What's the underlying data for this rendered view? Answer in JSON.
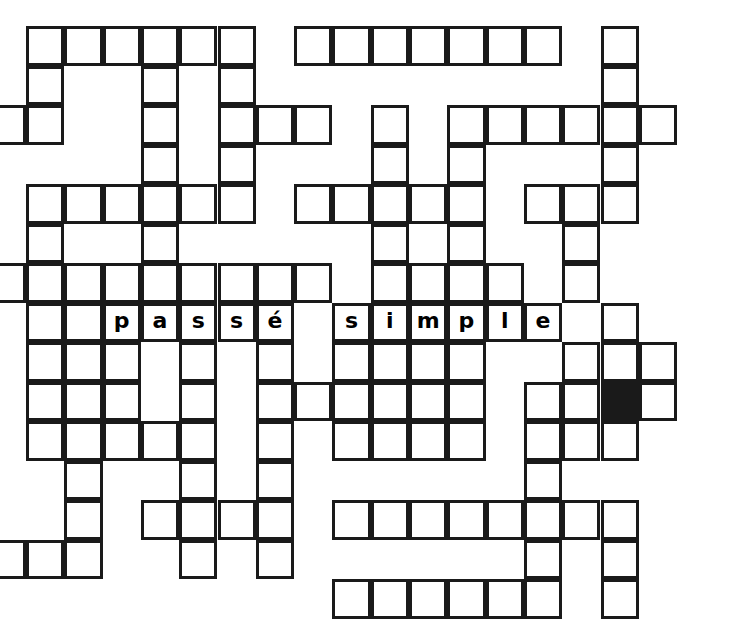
{
  "puzzle": {
    "type": "crossword-grid",
    "title": "passé simple crossword grid",
    "columns": 18,
    "rows": 15,
    "cell_size": 38.3,
    "row_size": 39.5,
    "origin_x": 26,
    "origin_y": 26,
    "colors": {
      "grid_line": "#1a1a1a",
      "cell_background": "#ffffff",
      "blocked_cell": "#1a1a1a",
      "page_background": "#ffffff"
    },
    "answer_entry": {
      "text": "passé simple",
      "word_one": "passé",
      "word_two": "simple",
      "row": 8,
      "word_one_start_col": 3,
      "word_two_start_col": 9
    },
    "blocked_cells": [
      {
        "row": 10,
        "col": 16
      }
    ],
    "letters": [
      {
        "row": 8,
        "col": 3,
        "char": "p"
      },
      {
        "row": 8,
        "col": 4,
        "char": "a"
      },
      {
        "row": 8,
        "col": 5,
        "char": "s"
      },
      {
        "row": 8,
        "col": 6,
        "char": "s"
      },
      {
        "row": 8,
        "col": 7,
        "char": "é"
      },
      {
        "row": 8,
        "col": 9,
        "char": "s"
      },
      {
        "row": 8,
        "col": 10,
        "char": "i"
      },
      {
        "row": 8,
        "col": 11,
        "char": "m"
      },
      {
        "row": 8,
        "col": 12,
        "char": "p"
      },
      {
        "row": 8,
        "col": 13,
        "char": "l"
      },
      {
        "row": 8,
        "col": 14,
        "char": "e"
      }
    ],
    "cells": [
      {
        "row": 1,
        "col": 1
      },
      {
        "row": 1,
        "col": 2
      },
      {
        "row": 1,
        "col": 3
      },
      {
        "row": 1,
        "col": 4
      },
      {
        "row": 1,
        "col": 5
      },
      {
        "row": 1,
        "col": 6
      },
      {
        "row": 1,
        "col": 8
      },
      {
        "row": 1,
        "col": 9
      },
      {
        "row": 1,
        "col": 10
      },
      {
        "row": 1,
        "col": 11
      },
      {
        "row": 1,
        "col": 12
      },
      {
        "row": 1,
        "col": 13
      },
      {
        "row": 1,
        "col": 14
      },
      {
        "row": 1,
        "col": 16
      },
      {
        "row": 2,
        "col": 1
      },
      {
        "row": 2,
        "col": 4
      },
      {
        "row": 2,
        "col": 6
      },
      {
        "row": 2,
        "col": 16
      },
      {
        "row": 3,
        "col": -1
      },
      {
        "row": 3,
        "col": 0
      },
      {
        "row": 3,
        "col": 1
      },
      {
        "row": 3,
        "col": 4
      },
      {
        "row": 3,
        "col": 6
      },
      {
        "row": 3,
        "col": 7
      },
      {
        "row": 3,
        "col": 8
      },
      {
        "row": 3,
        "col": 10
      },
      {
        "row": 3,
        "col": 12
      },
      {
        "row": 3,
        "col": 13
      },
      {
        "row": 3,
        "col": 14
      },
      {
        "row": 3,
        "col": 15
      },
      {
        "row": 3,
        "col": 16
      },
      {
        "row": 3,
        "col": 17
      },
      {
        "row": 4,
        "col": 4
      },
      {
        "row": 4,
        "col": 6
      },
      {
        "row": 4,
        "col": 10
      },
      {
        "row": 4,
        "col": 12
      },
      {
        "row": 4,
        "col": 16
      },
      {
        "row": 5,
        "col": 1
      },
      {
        "row": 5,
        "col": 2
      },
      {
        "row": 5,
        "col": 3
      },
      {
        "row": 5,
        "col": 4
      },
      {
        "row": 5,
        "col": 5
      },
      {
        "row": 5,
        "col": 6
      },
      {
        "row": 5,
        "col": 8
      },
      {
        "row": 5,
        "col": 9
      },
      {
        "row": 5,
        "col": 10
      },
      {
        "row": 5,
        "col": 11
      },
      {
        "row": 5,
        "col": 12
      },
      {
        "row": 5,
        "col": 14
      },
      {
        "row": 5,
        "col": 15
      },
      {
        "row": 5,
        "col": 16
      },
      {
        "row": 6,
        "col": 1
      },
      {
        "row": 6,
        "col": 4
      },
      {
        "row": 6,
        "col": 10
      },
      {
        "row": 6,
        "col": 12
      },
      {
        "row": 6,
        "col": 15
      },
      {
        "row": 7,
        "col": -1
      },
      {
        "row": 7,
        "col": 0
      },
      {
        "row": 7,
        "col": 1
      },
      {
        "row": 7,
        "col": 2
      },
      {
        "row": 7,
        "col": 3
      },
      {
        "row": 7,
        "col": 4
      },
      {
        "row": 7,
        "col": 5
      },
      {
        "row": 7,
        "col": 6
      },
      {
        "row": 7,
        "col": 7
      },
      {
        "row": 7,
        "col": 8
      },
      {
        "row": 7,
        "col": 10
      },
      {
        "row": 7,
        "col": 11
      },
      {
        "row": 7,
        "col": 12
      },
      {
        "row": 7,
        "col": 13
      },
      {
        "row": 7,
        "col": 15
      },
      {
        "row": 8,
        "col": 1
      },
      {
        "row": 8,
        "col": 2
      },
      {
        "row": 8,
        "col": 3
      },
      {
        "row": 8,
        "col": 4
      },
      {
        "row": 8,
        "col": 5
      },
      {
        "row": 8,
        "col": 6
      },
      {
        "row": 8,
        "col": 7
      },
      {
        "row": 8,
        "col": 9
      },
      {
        "row": 8,
        "col": 10
      },
      {
        "row": 8,
        "col": 11
      },
      {
        "row": 8,
        "col": 12
      },
      {
        "row": 8,
        "col": 13
      },
      {
        "row": 8,
        "col": 14
      },
      {
        "row": 8,
        "col": 16
      },
      {
        "row": 9,
        "col": 1
      },
      {
        "row": 9,
        "col": 2
      },
      {
        "row": 9,
        "col": 3
      },
      {
        "row": 9,
        "col": 5
      },
      {
        "row": 9,
        "col": 7
      },
      {
        "row": 9,
        "col": 9
      },
      {
        "row": 9,
        "col": 10
      },
      {
        "row": 9,
        "col": 11
      },
      {
        "row": 9,
        "col": 12
      },
      {
        "row": 9,
        "col": 15
      },
      {
        "row": 9,
        "col": 16
      },
      {
        "row": 9,
        "col": 17
      },
      {
        "row": 10,
        "col": 1
      },
      {
        "row": 10,
        "col": 2
      },
      {
        "row": 10,
        "col": 3
      },
      {
        "row": 10,
        "col": 5
      },
      {
        "row": 10,
        "col": 7
      },
      {
        "row": 10,
        "col": 8
      },
      {
        "row": 10,
        "col": 9
      },
      {
        "row": 10,
        "col": 10
      },
      {
        "row": 10,
        "col": 11
      },
      {
        "row": 10,
        "col": 12
      },
      {
        "row": 10,
        "col": 14
      },
      {
        "row": 10,
        "col": 15
      },
      {
        "row": 10,
        "col": 16
      },
      {
        "row": 10,
        "col": 17
      },
      {
        "row": 11,
        "col": 1
      },
      {
        "row": 11,
        "col": 2
      },
      {
        "row": 11,
        "col": 3
      },
      {
        "row": 11,
        "col": 4
      },
      {
        "row": 11,
        "col": 5
      },
      {
        "row": 11,
        "col": 7
      },
      {
        "row": 11,
        "col": 9
      },
      {
        "row": 11,
        "col": 10
      },
      {
        "row": 11,
        "col": 11
      },
      {
        "row": 11,
        "col": 12
      },
      {
        "row": 11,
        "col": 14
      },
      {
        "row": 11,
        "col": 15
      },
      {
        "row": 11,
        "col": 16
      },
      {
        "row": 12,
        "col": 2
      },
      {
        "row": 12,
        "col": 5
      },
      {
        "row": 12,
        "col": 7
      },
      {
        "row": 12,
        "col": 14
      },
      {
        "row": 13,
        "col": 2
      },
      {
        "row": 13,
        "col": 4
      },
      {
        "row": 13,
        "col": 5
      },
      {
        "row": 13,
        "col": 6
      },
      {
        "row": 13,
        "col": 7
      },
      {
        "row": 13,
        "col": 9
      },
      {
        "row": 13,
        "col": 10
      },
      {
        "row": 13,
        "col": 11
      },
      {
        "row": 13,
        "col": 12
      },
      {
        "row": 13,
        "col": 13
      },
      {
        "row": 13,
        "col": 14
      },
      {
        "row": 13,
        "col": 15
      },
      {
        "row": 13,
        "col": 16
      },
      {
        "row": 14,
        "col": -1
      },
      {
        "row": 14,
        "col": 0
      },
      {
        "row": 14,
        "col": 1
      },
      {
        "row": 14,
        "col": 2
      },
      {
        "row": 14,
        "col": 5
      },
      {
        "row": 14,
        "col": 7
      },
      {
        "row": 14,
        "col": 14
      },
      {
        "row": 14,
        "col": 16
      },
      {
        "row": 15,
        "col": 9
      },
      {
        "row": 15,
        "col": 10
      },
      {
        "row": 15,
        "col": 11
      },
      {
        "row": 15,
        "col": 12
      },
      {
        "row": 15,
        "col": 13
      },
      {
        "row": 15,
        "col": 14
      },
      {
        "row": 15,
        "col": 16
      }
    ]
  }
}
